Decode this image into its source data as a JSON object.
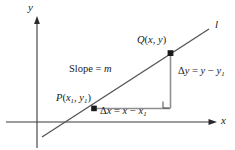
{
  "figure": {
    "kind": "coordinate-plane-slope-diagram",
    "axes": {
      "y_label": "y",
      "x_label": "x"
    },
    "line": {
      "label": "l"
    },
    "points": [
      {
        "name": "Q",
        "label_text": "Q(x, y)",
        "coord_x": "x",
        "coord_y": "y"
      },
      {
        "name": "P",
        "label_text": "P(x1, y1)",
        "coord_x": "x1",
        "coord_y": "y1"
      }
    ],
    "annotations": {
      "slope": {
        "lhs": "Slope",
        "eq": "=",
        "rhs": "m",
        "full_text": "Slope = m"
      },
      "delta_y": {
        "full_text": "Δy = y − y1"
      },
      "delta_x": {
        "full_text": "Δx = x − x1"
      }
    },
    "glyphs": {
      "delta": "Δ",
      "minus": "−",
      "equals": "=",
      "open_paren": "(",
      "close_paren": ")",
      "comma": ",",
      "one": "1"
    },
    "colors": {
      "ink": "#1a1a1a",
      "axis": "#3a3a3a",
      "line": "#555555",
      "leg": "#8c8c8c",
      "background": "#ffffff"
    }
  }
}
